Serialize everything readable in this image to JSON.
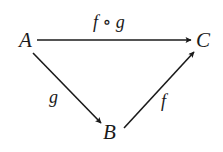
{
  "diagram": {
    "type": "commutative-diagram",
    "colors": {
      "ink": "#1a1a1a",
      "background": "#ffffff"
    },
    "nodes": {
      "A": {
        "label": "A",
        "x": 27,
        "y": 40
      },
      "B": {
        "label": "B",
        "x": 110,
        "y": 133
      },
      "C": {
        "label": "C",
        "x": 203,
        "y": 40
      }
    },
    "arrows": {
      "composite": {
        "from": "A",
        "to": "C",
        "label": "f ∘ g"
      },
      "g": {
        "from": "A",
        "to": "B",
        "label": "g"
      },
      "f": {
        "from": "B",
        "to": "C",
        "label": "f"
      }
    }
  }
}
